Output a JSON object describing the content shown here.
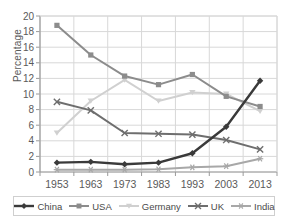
{
  "chart_data": {
    "type": "line",
    "title": "",
    "xlabel": "",
    "ylabel": "Percentage",
    "x": [
      1953,
      1963,
      1973,
      1983,
      1993,
      2003,
      2013
    ],
    "categories": [
      "1953",
      "1963",
      "1973",
      "1983",
      "1993",
      "2003",
      "2013"
    ],
    "ylim": [
      0,
      20
    ],
    "yticks": [
      0,
      2,
      4,
      6,
      8,
      10,
      12,
      14,
      16,
      18,
      20
    ],
    "ytick_labels": [
      "0",
      "2",
      "4",
      "6",
      "8",
      "10",
      "12",
      "14",
      "16",
      "18",
      "20"
    ],
    "grid": true,
    "legend_position": "bottom",
    "series": [
      {
        "name": "China",
        "color": "#3a3a3a",
        "marker": "diamond",
        "values": [
          1.2,
          1.3,
          1.0,
          1.2,
          2.4,
          5.8,
          11.7
        ]
      },
      {
        "name": "USA",
        "color": "#8c8c8c",
        "marker": "square",
        "values": [
          18.8,
          15.0,
          12.3,
          11.2,
          12.5,
          9.7,
          8.4
        ]
      },
      {
        "name": "Germany",
        "color": "#d0d0d0",
        "marker": "triangle",
        "values": [
          5.0,
          9.1,
          11.8,
          9.1,
          10.2,
          10.0,
          7.8
        ]
      },
      {
        "name": "UK",
        "color": "#6e6e6e",
        "marker": "x",
        "values": [
          9.0,
          7.9,
          5.0,
          4.9,
          4.8,
          4.1,
          2.9
        ]
      },
      {
        "name": "India",
        "color": "#a8a8a8",
        "marker": "star",
        "values": [
          0.3,
          0.3,
          0.3,
          0.35,
          0.6,
          0.75,
          1.7
        ]
      }
    ]
  },
  "axis": {
    "y_title": "Percentage"
  },
  "legend": {
    "items": [
      {
        "label": "China"
      },
      {
        "label": "USA"
      },
      {
        "label": "Germany"
      },
      {
        "label": "UK"
      },
      {
        "label": "India"
      }
    ]
  }
}
